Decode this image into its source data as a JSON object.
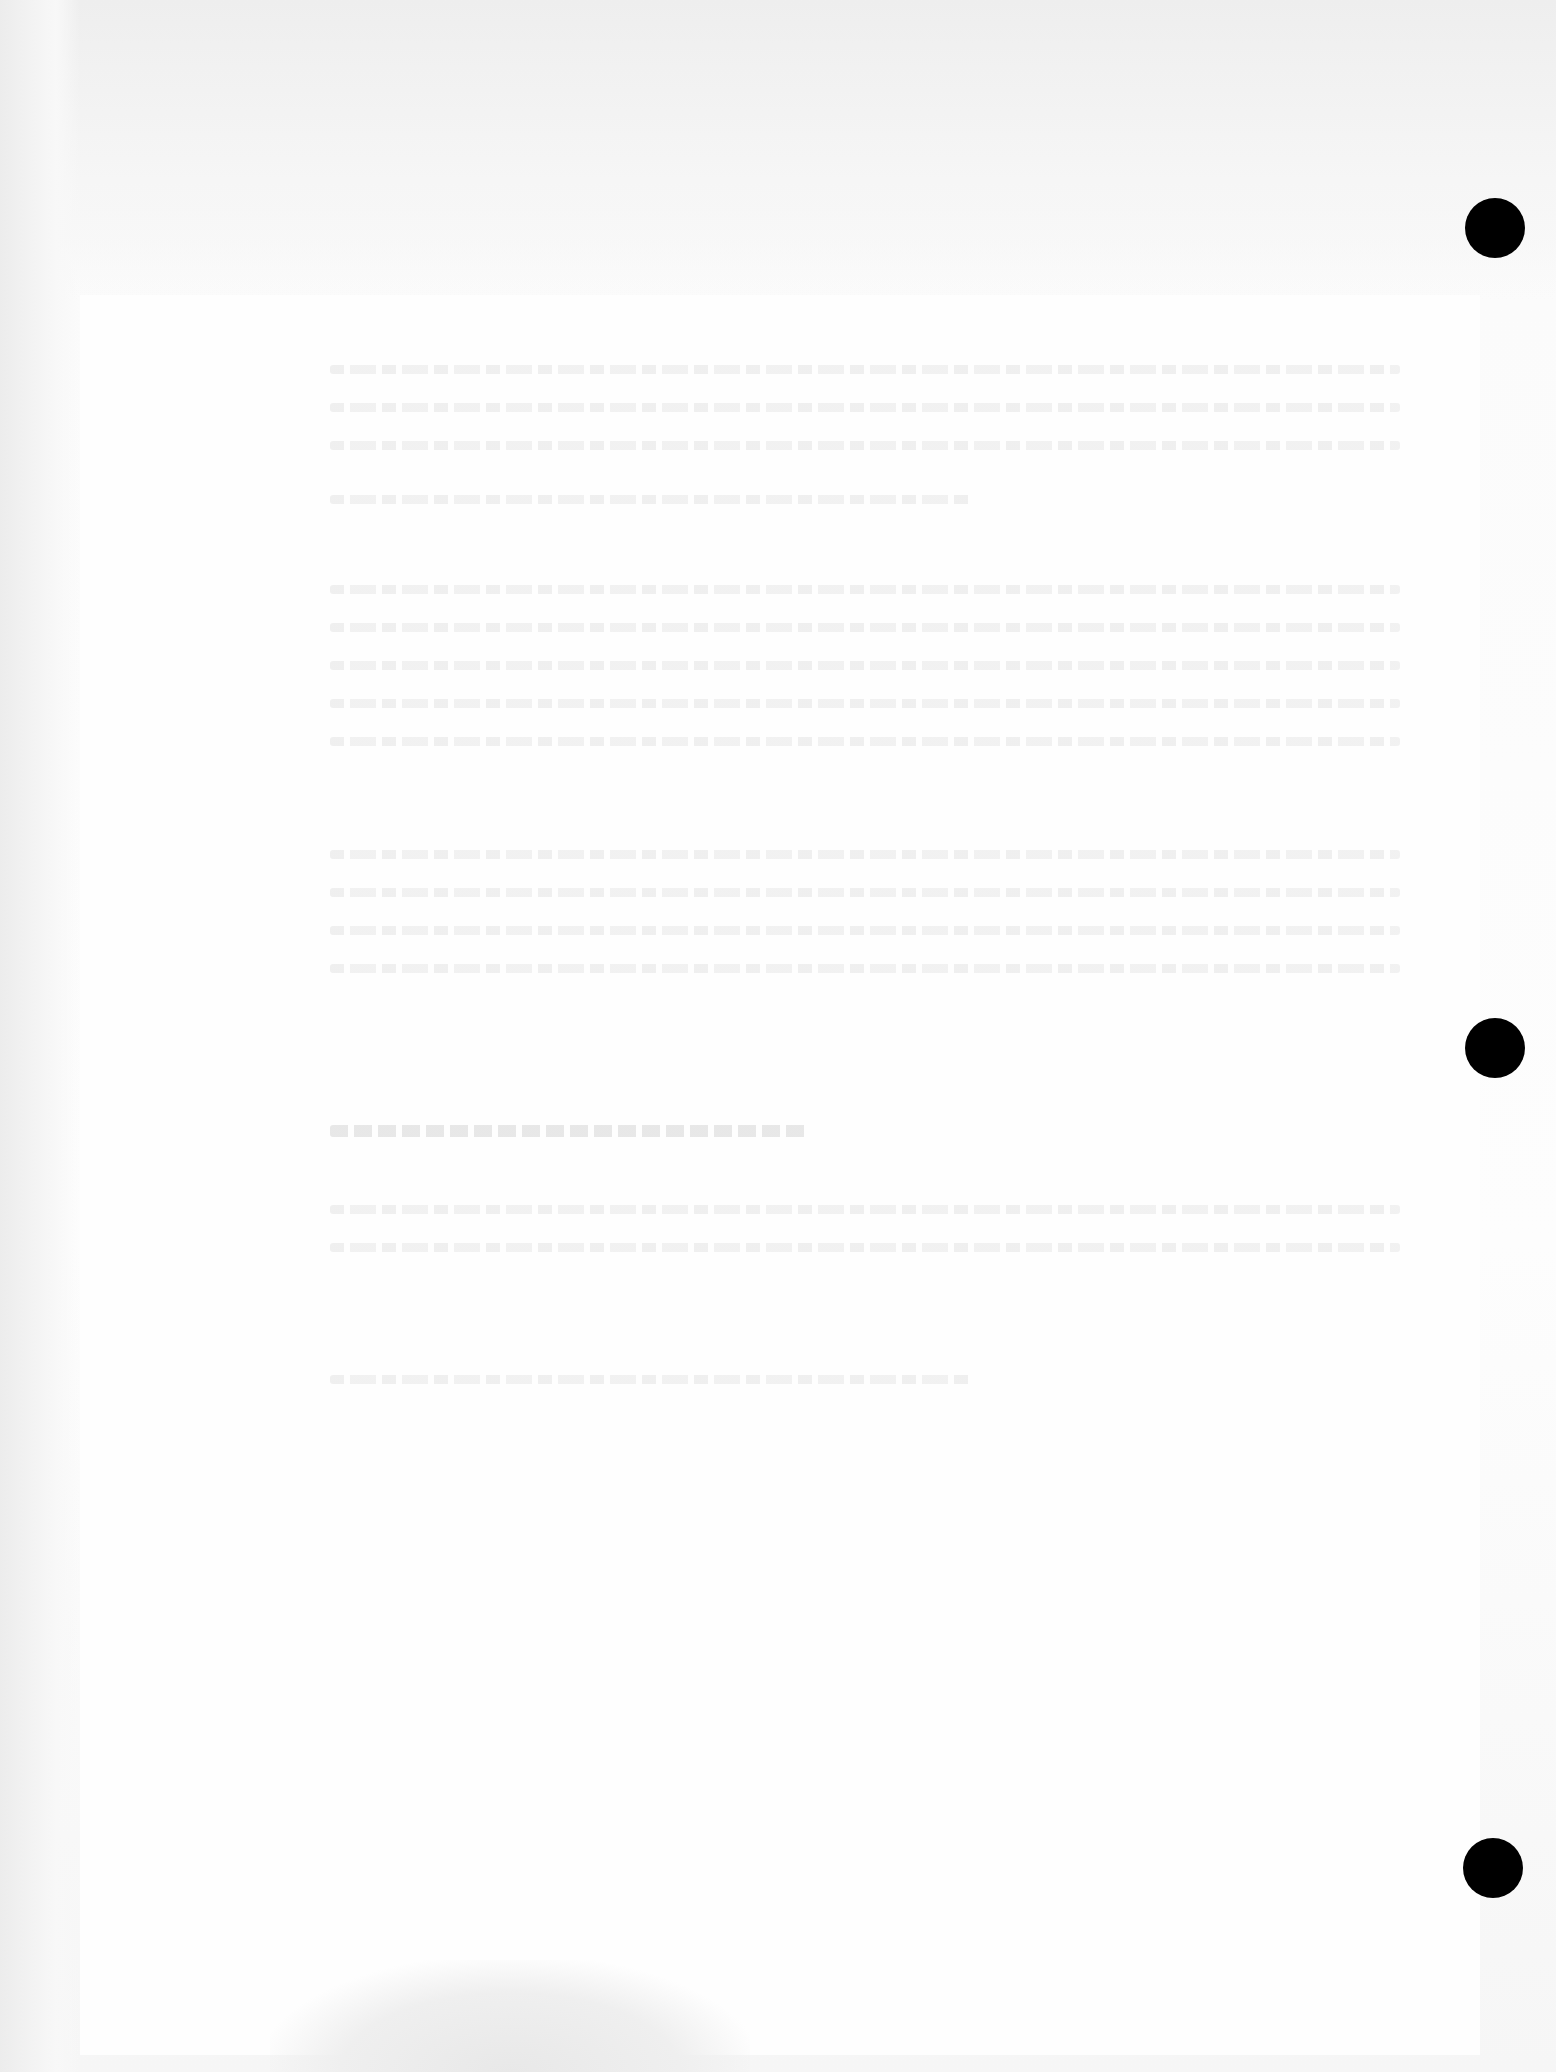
{
  "document": {
    "type": "scanned hole-punched page",
    "legibility": "text too faded to read",
    "paragraphs": [
      {
        "lines": 4,
        "text": "[illegible faded text]"
      },
      {
        "lines": 1,
        "text": "[illegible faded text]"
      },
      {
        "lines": 5,
        "text": "[illegible faded text]"
      },
      {
        "lines": 4,
        "text": "[illegible faded text]"
      },
      {
        "lines": 1,
        "text": "[illegible faded heading]"
      },
      {
        "lines": 2,
        "text": "[illegible faded text]"
      },
      {
        "lines": 1,
        "text": "[illegible faded text]"
      }
    ],
    "punch_holes": 3
  },
  "colors": {
    "paper": "#fdfdfd",
    "hole": "#000000",
    "faded_text": "#e8e8e8"
  }
}
